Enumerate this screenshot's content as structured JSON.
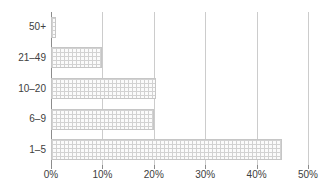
{
  "chart_data": {
    "type": "bar",
    "orientation": "horizontal",
    "title": "",
    "subtitle": "",
    "xlabel": "",
    "ylabel": "",
    "categories": [
      "1–5",
      "6–9",
      "10–20",
      "21–49",
      "50+"
    ],
    "values": [
      45,
      20,
      20.5,
      10,
      1
    ],
    "xlim": [
      0,
      50
    ],
    "xticks": [
      0,
      10,
      20,
      30,
      40,
      50
    ],
    "xtick_labels": [
      "0%",
      "10%",
      "20%",
      "30%",
      "40%",
      "50%"
    ],
    "ytick_labels_top_to_bottom": [
      "50+",
      "21–49",
      "10–20",
      "6–9",
      "1–5"
    ],
    "grid": true,
    "grid_axis": "x",
    "legend": false,
    "legend_position": "none",
    "bar_fill_color": "#fbfbfb",
    "bar_pattern_color": "#d2d2d2",
    "bar_border_color": "#c6c6c6",
    "gridline_color": "#cccccc",
    "axis_color": "#8c8c8c",
    "text_color": "#404040",
    "background_color": "#ffffff"
  },
  "bars_top_to_bottom": [
    {
      "label": "50+",
      "value": 1,
      "value_label": "1%"
    },
    {
      "label": "21–49",
      "value": 10,
      "value_label": "10%"
    },
    {
      "label": "10–20",
      "value": 20.5,
      "value_label": "20.5%"
    },
    {
      "label": "6–9",
      "value": 20,
      "value_label": "20%"
    },
    {
      "label": "1–5",
      "value": 45,
      "value_label": "45%"
    }
  ],
  "x_axis": {
    "ticks": [
      {
        "label": "0%",
        "value": 0
      },
      {
        "label": "10%",
        "value": 10
      },
      {
        "label": "20%",
        "value": 20
      },
      {
        "label": "30%",
        "value": 30
      },
      {
        "label": "40%",
        "value": 40
      },
      {
        "label": "50%",
        "value": 50
      }
    ]
  }
}
